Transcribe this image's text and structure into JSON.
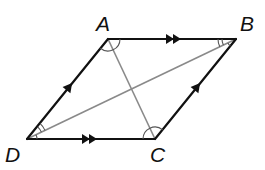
{
  "figure": {
    "type": "parallelogram",
    "vertices": {
      "A": {
        "label": "A",
        "x": 108,
        "y": 39
      },
      "B": {
        "label": "B",
        "x": 236,
        "y": 39
      },
      "C": {
        "label": "C",
        "x": 155,
        "y": 139
      },
      "D": {
        "label": "D",
        "x": 27,
        "y": 139
      }
    },
    "sides": [
      {
        "from": "A",
        "to": "B",
        "marker": "double-arrow"
      },
      {
        "from": "D",
        "to": "C",
        "marker": "double-arrow"
      },
      {
        "from": "D",
        "to": "A",
        "marker": "single-arrow"
      },
      {
        "from": "C",
        "to": "B",
        "marker": "single-arrow"
      }
    ],
    "diagonals": [
      {
        "from": "A",
        "to": "C"
      },
      {
        "from": "B",
        "to": "D"
      }
    ],
    "angle_marks": [
      {
        "vertex": "A",
        "arcs": 1,
        "between": [
          "D",
          "B"
        ]
      },
      {
        "vertex": "C",
        "arcs": 1,
        "between": [
          "B",
          "D"
        ]
      },
      {
        "vertex": "B",
        "arcs": 2,
        "between": [
          "A",
          "D"
        ]
      },
      {
        "vertex": "B",
        "arcs": 1,
        "between": [
          "D",
          "C"
        ],
        "style": "small"
      },
      {
        "vertex": "D",
        "arcs": 2,
        "between": [
          "A",
          "B"
        ]
      },
      {
        "vertex": "D",
        "arcs": 1,
        "between": [
          "B",
          "C"
        ],
        "style": "small"
      }
    ],
    "colors": {
      "sides": "#111111",
      "diagonals": "#8a8a8a",
      "arcs": "#555555"
    }
  }
}
